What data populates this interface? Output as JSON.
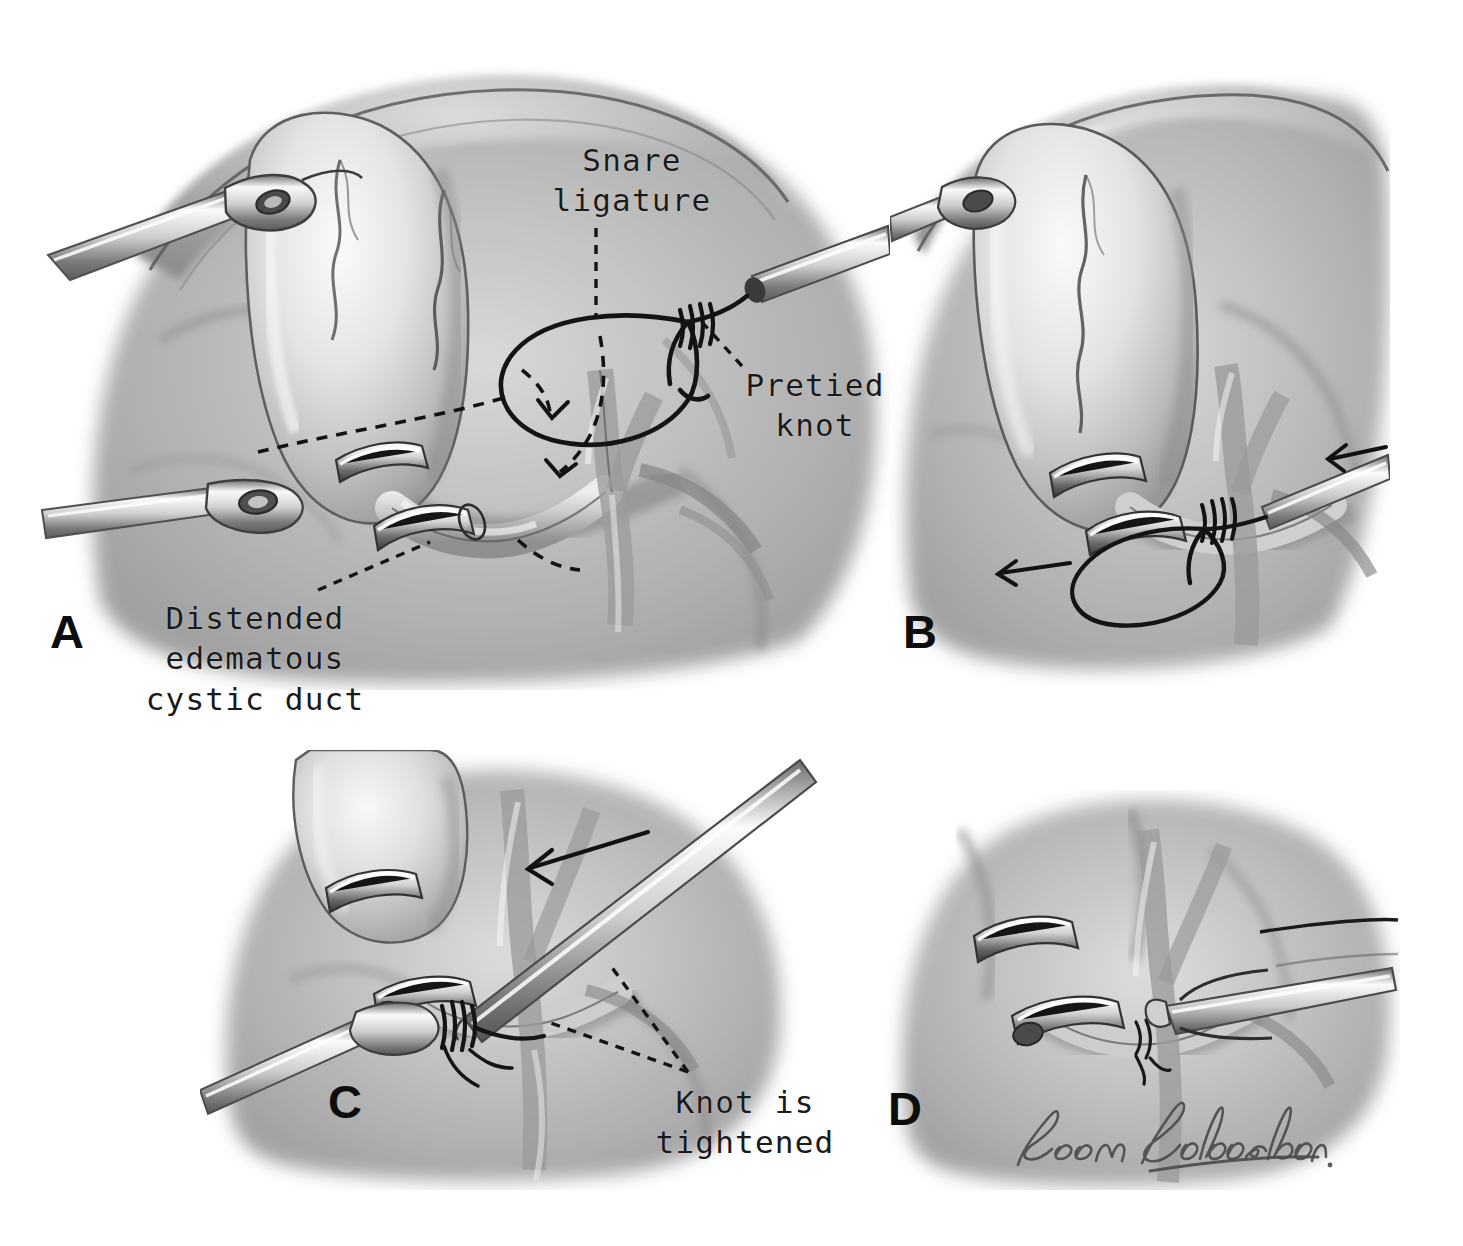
{
  "figure": {
    "kind": "medical-illustration",
    "medium": "graphite pencil drawing, grayscale",
    "background_color": "#ffffff",
    "ink_color": "#1a1a1a",
    "panel_count": 4
  },
  "panels": [
    {
      "id": "A",
      "letter": "A",
      "caption": "Snare ligature loop passed around the distended edematous cystic duct; pretied knot on the ligature carrier",
      "elements": [
        "gallbladder",
        "liver edge",
        "grasper on fundus",
        "grasper on Hartmann pouch",
        "clipped cystic duct",
        "cystic artery",
        "snare loop",
        "pretied knot",
        "dashed path arrows"
      ]
    },
    {
      "id": "B",
      "letter": "B",
      "caption": "Loop drawn down over the duct while counter-traction is applied",
      "elements": [
        "gallbladder",
        "clipped duct",
        "snare loop encircling duct",
        "traction arrows"
      ]
    },
    {
      "id": "C",
      "letter": "C",
      "caption": "Knot pusher advances the pretied knot; knot is tightened on the cystic duct",
      "elements": [
        "knot pusher",
        "push arrow",
        "tightened knot",
        "clipped duct",
        "grasper"
      ]
    },
    {
      "id": "D",
      "letter": "D",
      "caption": "Suture tails cut with scissors, completing the ligature",
      "elements": [
        "scissors",
        "ligated duct stump",
        "suture tails",
        "clip"
      ]
    }
  ],
  "labels": [
    {
      "name": "snare-ligature",
      "text": "Snare\nligature",
      "lines": [
        "Snare",
        "ligature"
      ],
      "align": "center",
      "panel": "A"
    },
    {
      "name": "pretied-knot",
      "text": "Pretied\nknot",
      "lines": [
        "Pretied",
        "knot"
      ],
      "align": "center",
      "panel": "A"
    },
    {
      "name": "distended-edematous-cystic-duct",
      "text": "Distended\nedematous\ncystic duct",
      "lines": [
        "Distended",
        "edematous",
        "cystic duct"
      ],
      "align": "center",
      "panel": "A"
    },
    {
      "name": "knot-is-tightened",
      "text": "Knot is\ntightened",
      "lines": [
        "Knot is",
        "tightened"
      ],
      "align": "center",
      "panel": "C"
    }
  ],
  "panel_letters": [
    "A",
    "B",
    "C",
    "D"
  ],
  "signature": {
    "name": "artist-signature",
    "text": "Leon Schlossberg",
    "style": "cursive handwriting",
    "panel": "D"
  }
}
